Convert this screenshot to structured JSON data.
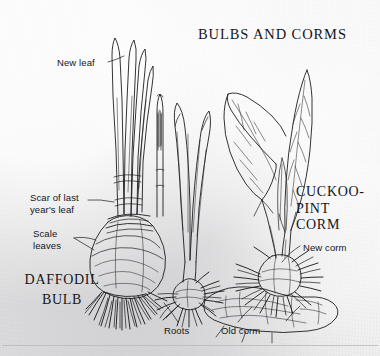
{
  "figure": {
    "title": "BULBS AND CORMS",
    "medium": "pen-and-ink botanical line drawing on aged paper",
    "background_color": "#ebebec",
    "ink_color": "#1a1a1c",
    "text_color": "#14161a"
  },
  "headings": {
    "title": "BULBS AND CORMS",
    "daffodil_line1": "DAFFODIL",
    "daffodil_line2": "BULB",
    "cuckoo_line1": "CUCKOO-",
    "cuckoo_line2": "PINT",
    "cuckoo_line3": "CORM"
  },
  "labels": {
    "new_leaf": "New leaf",
    "scar_line1": "Scar of last",
    "scar_line2": "year's leaf",
    "scale_line1": "Scale",
    "scale_line2": "leaves",
    "new_corm": "New corm",
    "roots": "Roots",
    "old_corm": "Old corm"
  },
  "specimens": [
    {
      "name": "daffodil-bulb",
      "common_name": "Daffodil",
      "storage_organ": "bulb",
      "parts": [
        "new leaf",
        "scar of last year's leaf",
        "scale leaves",
        "roots"
      ]
    },
    {
      "name": "cuckoo-pint-young",
      "common_name": "Cuckoo-pint (young shoot)",
      "storage_organ": "corm",
      "parts": [
        "leaves",
        "old corm",
        "roots"
      ]
    },
    {
      "name": "cuckoo-pint-corm",
      "common_name": "Cuckoo-pint",
      "storage_organ": "corm",
      "parts": [
        "leaves",
        "new corm",
        "old corm",
        "roots"
      ]
    }
  ]
}
